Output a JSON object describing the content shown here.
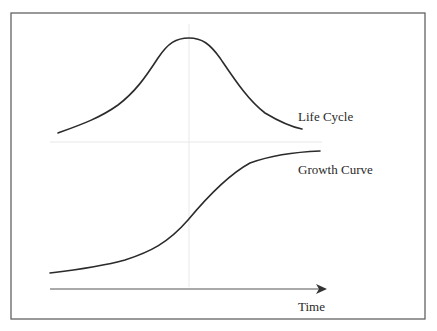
{
  "diagram": {
    "labels": {
      "life_cycle": "Life Cycle",
      "growth_curve": "Growth Curve",
      "x_axis": "Time"
    },
    "colors": {
      "frame": "#555555",
      "curve": "#2b2b2b",
      "guide": "#e6e6e6",
      "axis": "#444444",
      "background": "#ffffff"
    },
    "elements": [
      {
        "id": "life-cycle-curve",
        "shape": "bell",
        "description": "rises, peaks at midpoint, declines"
      },
      {
        "id": "growth-curve",
        "shape": "s-curve",
        "description": "slow start, accelerates, then levels off"
      },
      {
        "id": "time-axis",
        "shape": "arrow",
        "direction": "right"
      },
      {
        "id": "midpoint-guide",
        "shape": "vertical faint line"
      },
      {
        "id": "separator-guide",
        "shape": "horizontal faint line"
      }
    ]
  }
}
